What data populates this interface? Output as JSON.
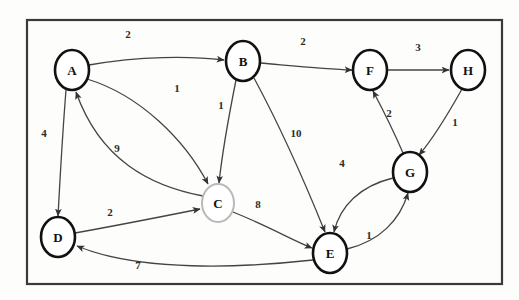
{
  "diagram": {
    "type": "directed-weighted-graph",
    "frame": {
      "x": 27,
      "y": 20,
      "width": 475,
      "height": 264,
      "stroke_color": "#3a3a3a",
      "stroke_width": 2.2
    },
    "style": {
      "node_stroke_normal": "#111111",
      "node_stroke_highlight": "#b9b9b9",
      "node_fill": "#ffffff",
      "edge_color": "#444444",
      "label_color": "#2b2b2b",
      "background": "#fdfdfc"
    },
    "nodes": [
      {
        "id": "A",
        "label": "A",
        "cx": 72,
        "cy": 70,
        "rx": 17,
        "ry": 20,
        "emphasis": "bold",
        "stroke": "#111111",
        "stroke_width": 2.6
      },
      {
        "id": "B",
        "label": "B",
        "cx": 243,
        "cy": 61,
        "rx": 17,
        "ry": 20,
        "emphasis": "bold",
        "stroke": "#111111",
        "stroke_width": 2.6
      },
      {
        "id": "C",
        "label": "C",
        "cx": 218,
        "cy": 203,
        "rx": 16,
        "ry": 19,
        "emphasis": "light",
        "stroke": "#b9b9b9",
        "stroke_width": 2.0
      },
      {
        "id": "D",
        "label": "D",
        "cx": 58,
        "cy": 237,
        "rx": 17,
        "ry": 20,
        "emphasis": "bold",
        "stroke": "#111111",
        "stroke_width": 2.6
      },
      {
        "id": "E",
        "label": "E",
        "cx": 330,
        "cy": 253,
        "rx": 17,
        "ry": 20,
        "emphasis": "bold",
        "stroke": "#111111",
        "stroke_width": 2.6
      },
      {
        "id": "F",
        "label": "F",
        "cx": 370,
        "cy": 70,
        "rx": 17,
        "ry": 20,
        "emphasis": "bold",
        "stroke": "#111111",
        "stroke_width": 2.6
      },
      {
        "id": "G",
        "label": "G",
        "cx": 410,
        "cy": 172,
        "rx": 17,
        "ry": 20,
        "emphasis": "bold",
        "stroke": "#111111",
        "stroke_width": 2.6
      },
      {
        "id": "H",
        "label": "H",
        "cx": 468,
        "cy": 70,
        "rx": 17,
        "ry": 20,
        "emphasis": "bold",
        "stroke": "#111111",
        "stroke_width": 2.6
      }
    ],
    "edges": [
      {
        "id": "A-B",
        "from": "A",
        "to": "B",
        "weight": "2",
        "label_x": 128,
        "label_y": 34,
        "path": "M 89 65 C 140 56, 190 56, 224 60"
      },
      {
        "id": "A-C",
        "from": "A",
        "to": "C",
        "weight": "1",
        "label_x": 177,
        "label_y": 88,
        "path": "M 87 79 C 140 95, 185 140, 208 184"
      },
      {
        "id": "A-D",
        "from": "A",
        "to": "D",
        "weight": "4",
        "label_x": 44,
        "label_y": 133,
        "path": "M 66 90 C 62 140, 60 180, 58 216"
      },
      {
        "id": "B-C",
        "from": "B",
        "to": "C",
        "weight": "1",
        "label_x": 221,
        "label_y": 105,
        "path": "M 236 80 C 228 120, 222 155, 219 183"
      },
      {
        "id": "B-E",
        "from": "B",
        "to": "E",
        "weight": "10",
        "label_x": 296,
        "label_y": 133,
        "path": "M 254 78 C 282 130, 308 190, 325 232"
      },
      {
        "id": "B-F",
        "from": "B",
        "to": "F",
        "weight": "2",
        "label_x": 303,
        "label_y": 41,
        "path": "M 260 63 C 295 66, 325 69, 352 70"
      },
      {
        "id": "C-A",
        "from": "C",
        "to": "A",
        "weight": "9",
        "label_x": 117,
        "label_y": 148,
        "path": "M 203 196 C 150 186, 100 160, 76 92"
      },
      {
        "id": "C-E",
        "from": "C",
        "to": "E",
        "weight": "8",
        "label_x": 258,
        "label_y": 204,
        "path": "M 233 212 C 268 226, 292 240, 312 248"
      },
      {
        "id": "D-C",
        "from": "D",
        "to": "C",
        "weight": "2",
        "label_x": 110,
        "label_y": 212,
        "path": "M 75 233 C 125 224, 170 215, 200 209"
      },
      {
        "id": "E-D",
        "from": "E",
        "to": "D",
        "weight": "7",
        "label_x": 138,
        "label_y": 265,
        "path": "M 313 260 C 240 268, 140 272, 77 246"
      },
      {
        "id": "E-G",
        "from": "E",
        "to": "G",
        "weight": "1",
        "label_x": 369,
        "label_y": 235,
        "path": "M 347 249 C 380 241, 400 220, 408 193"
      },
      {
        "id": "G-E",
        "from": "G",
        "to": "E",
        "weight": "4",
        "label_x": 342,
        "label_y": 163,
        "path": "M 393 178 C 360 186, 340 206, 334 232"
      },
      {
        "id": "G-F",
        "from": "G",
        "to": "F",
        "weight": "2",
        "label_x": 389,
        "label_y": 113,
        "path": "M 403 153 C 394 132, 382 108, 373 91"
      },
      {
        "id": "F-H",
        "from": "F",
        "to": "H",
        "weight": "3",
        "label_x": 418,
        "label_y": 47,
        "path": "M 387 70 C 410 70, 428 70, 449 70"
      },
      {
        "id": "H-G",
        "from": "H",
        "to": "G",
        "weight": "1",
        "label_x": 455,
        "label_y": 122,
        "path": "M 462 89 C 448 114, 432 140, 419 155"
      }
    ]
  }
}
